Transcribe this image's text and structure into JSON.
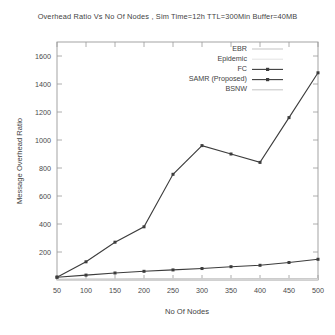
{
  "chart_data": {
    "type": "line",
    "title": "Overhead Ratio Vs No Of Nodes , Sim Time=12h TTL=300Min Buffer=40MB",
    "xlabel": "No Of Nodes",
    "ylabel": "Message Overhead Ratio",
    "x": [
      50,
      100,
      150,
      200,
      250,
      300,
      350,
      400,
      450,
      500
    ],
    "xlim": [
      50,
      500
    ],
    "ylim": [
      0,
      1700
    ],
    "xticks": [
      "50",
      "100",
      "150",
      "200",
      "250",
      "300",
      "350",
      "400",
      "450",
      "500"
    ],
    "yticks": [
      "200",
      "400",
      "600",
      "800",
      "1000",
      "1200",
      "1400",
      "1600"
    ],
    "grid": false,
    "legend_position": "top-right-inside",
    "series": [
      {
        "name": "EBR",
        "color": "#c9c9c9",
        "marker": "none",
        "values": [
          5,
          6,
          7,
          8,
          8,
          9,
          9,
          10,
          10,
          11
        ]
      },
      {
        "name": "Epidemic",
        "color": "#e4e4e4",
        "marker": "none",
        "values": [
          3,
          3,
          4,
          4,
          5,
          5,
          5,
          6,
          6,
          6
        ]
      },
      {
        "name": "FC",
        "color": "#3c3c3c",
        "marker": "square",
        "values": [
          20,
          130,
          270,
          380,
          755,
          960,
          900,
          840,
          1160,
          1480
        ]
      },
      {
        "name": "SAMR (Proposed)",
        "color": "#3c3c3c",
        "marker": "square",
        "values": [
          20,
          35,
          50,
          62,
          72,
          82,
          95,
          105,
          125,
          148
        ]
      },
      {
        "name": "BSNW",
        "color": "#c9c9c9",
        "marker": "none",
        "values": [
          4,
          5,
          5,
          6,
          6,
          7,
          7,
          8,
          8,
          9
        ]
      }
    ]
  },
  "legend": {
    "items": [
      {
        "label": "EBR"
      },
      {
        "label": "Epidemic"
      },
      {
        "label": "FC"
      },
      {
        "label": "SAMR (Proposed)"
      },
      {
        "label": "BSNW"
      }
    ]
  },
  "axes": {
    "y_title": "Message Overhead Ratio",
    "x_title": "No Of Nodes",
    "y_tick_labels": [
      "1600",
      "1400",
      "1200",
      "1000",
      "800",
      "600",
      "400",
      "200"
    ],
    "x_tick_labels": [
      "50",
      "100",
      "150",
      "200",
      "250",
      "300",
      "350",
      "400",
      "450",
      "500"
    ]
  }
}
